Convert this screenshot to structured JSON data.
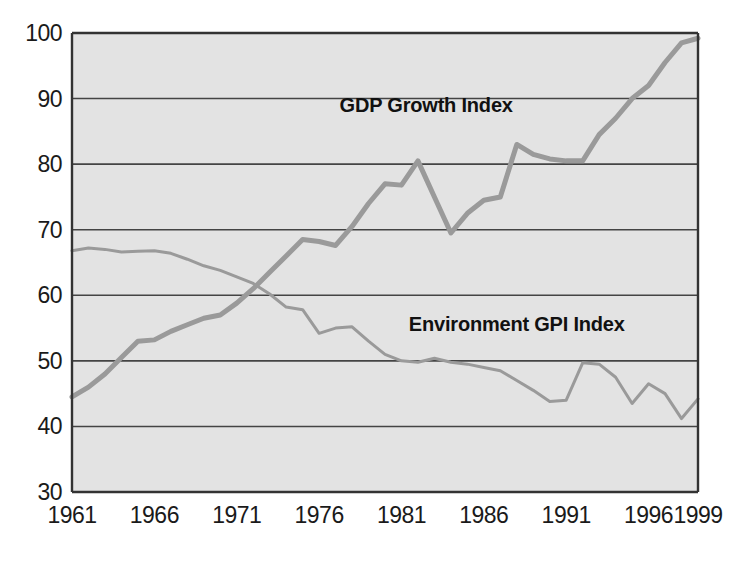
{
  "chart_data": {
    "type": "line",
    "title": "",
    "subtitle": "",
    "xlabel": "",
    "ylabel": "",
    "xlim": [
      1961,
      1999
    ],
    "ylim": [
      30,
      100
    ],
    "grid": "horizontal",
    "legend_position": "inline-annotations",
    "plot_background": "#e3e3e3",
    "line_color": "#9a9a9a",
    "axis_color": "#333333",
    "grid_color": "#444444",
    "x_ticks": [
      "1961",
      "1966",
      "1971",
      "1976",
      "1981",
      "1986",
      "1991",
      "1996",
      "1999"
    ],
    "x_tick_values": [
      1961,
      1966,
      1971,
      1976,
      1981,
      1986,
      1991,
      1996,
      1999
    ],
    "y_ticks": [
      "30",
      "40",
      "50",
      "60",
      "70",
      "80",
      "90",
      "100"
    ],
    "y_tick_values": [
      30,
      40,
      50,
      60,
      70,
      80,
      90,
      100
    ],
    "x": [
      1961,
      1962,
      1963,
      1964,
      1965,
      1966,
      1967,
      1968,
      1969,
      1970,
      1971,
      1972,
      1973,
      1974,
      1975,
      1976,
      1977,
      1978,
      1979,
      1980,
      1981,
      1982,
      1983,
      1984,
      1985,
      1986,
      1987,
      1988,
      1989,
      1990,
      1991,
      1992,
      1993,
      1994,
      1995,
      1996,
      1997,
      1998,
      1999
    ],
    "series": [
      {
        "name": "GDP Growth Index",
        "label": "GDP Growth Index",
        "label_x": 1982.5,
        "label_y": 88.0,
        "color": "#9a9a9a",
        "width": 5,
        "values": [
          44.5,
          46.0,
          48.0,
          50.5,
          53.0,
          53.2,
          54.5,
          55.5,
          56.5,
          57.0,
          58.8,
          61.0,
          63.5,
          66.0,
          68.5,
          68.2,
          67.6,
          70.5,
          74.0,
          77.0,
          76.8,
          80.5,
          75.0,
          69.5,
          72.5,
          74.5,
          75.0,
          83.0,
          81.5,
          80.8,
          80.5,
          80.5,
          84.5,
          87.0,
          90.0,
          92.0,
          95.5,
          98.5,
          99.2
        ]
      },
      {
        "name": "Environment GPI Index",
        "label": "Environment GPI Index",
        "label_x": 1988.0,
        "label_y": 54.5,
        "color": "#9a9a9a",
        "width": 3,
        "values": [
          66.8,
          67.2,
          67.0,
          66.6,
          66.7,
          66.8,
          66.4,
          65.5,
          64.5,
          63.8,
          62.8,
          61.8,
          60.2,
          58.2,
          57.8,
          54.2,
          55.0,
          55.2,
          53.0,
          51.0,
          50.0,
          49.8,
          50.4,
          49.8,
          49.5,
          49.0,
          48.5,
          47.0,
          45.5,
          43.8,
          44.0,
          49.7,
          49.5,
          47.5,
          43.5,
          46.5,
          45.0,
          41.2,
          44.2
        ]
      }
    ],
    "annotations": [
      {
        "text": "GDP Growth Index",
        "x": 1982.5,
        "y": 88.0
      },
      {
        "text": "Environment GPI Index",
        "x": 1988.0,
        "y": 54.5
      }
    ]
  }
}
